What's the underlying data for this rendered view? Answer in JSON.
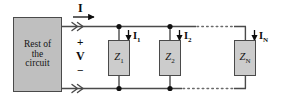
{
  "diagram": {
    "type": "circuit-schematic",
    "colors": {
      "wire": "#4a4a4a",
      "source_fill": "#bfbfbf",
      "impedance_fill": "#cccccc",
      "outline": "#4a4a4a",
      "text": "#0d0d0d",
      "background": "#ffffff"
    },
    "source_block": {
      "lines": [
        "Rest of",
        "the",
        "circuit"
      ]
    },
    "terminal_labels": {
      "current_total": "I",
      "voltage": "V",
      "plus": "+",
      "minus": "−"
    },
    "branches": [
      {
        "impedance": "Z",
        "impedance_sub": "1",
        "current": "I",
        "current_sub": "1"
      },
      {
        "impedance": "Z",
        "impedance_sub": "2",
        "current": "I",
        "current_sub": "2"
      },
      {
        "impedance": "Z",
        "impedance_sub": "N",
        "current": "I",
        "current_sub": "N"
      }
    ],
    "continuation": "dotted-ellipsis"
  }
}
